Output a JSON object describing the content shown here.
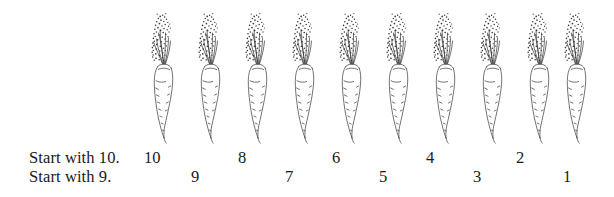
{
  "page": {
    "kind": "counting-worksheet",
    "background_color": "#ffffff",
    "ink_color": "#1a1a1a"
  },
  "illustration": {
    "item_name": "carrot",
    "icon": "carrot-icon",
    "count": 10,
    "items": [
      {
        "index": 1,
        "left": 143
      },
      {
        "index": 2,
        "left": 190
      },
      {
        "index": 3,
        "left": 237
      },
      {
        "index": 4,
        "left": 284
      },
      {
        "index": 5,
        "left": 331
      },
      {
        "index": 6,
        "left": 378
      },
      {
        "index": 7,
        "left": 425
      },
      {
        "index": 8,
        "left": 472
      },
      {
        "index": 9,
        "left": 519
      },
      {
        "index": 10,
        "left": 556
      }
    ]
  },
  "rows": [
    {
      "id": "start-with-10",
      "caption": "Start with 10.",
      "numbers": [
        {
          "value": "10",
          "left": 144
        },
        {
          "value": "8",
          "left": 238
        },
        {
          "value": "6",
          "left": 332
        },
        {
          "value": "4",
          "left": 426
        },
        {
          "value": "2",
          "left": 516
        }
      ]
    },
    {
      "id": "start-with-9",
      "caption": "Start with 9.",
      "numbers": [
        {
          "value": "9",
          "left": 191
        },
        {
          "value": "7",
          "left": 285
        },
        {
          "value": "5",
          "left": 379
        },
        {
          "value": "3",
          "left": 473
        },
        {
          "value": "1",
          "left": 563
        }
      ]
    }
  ]
}
